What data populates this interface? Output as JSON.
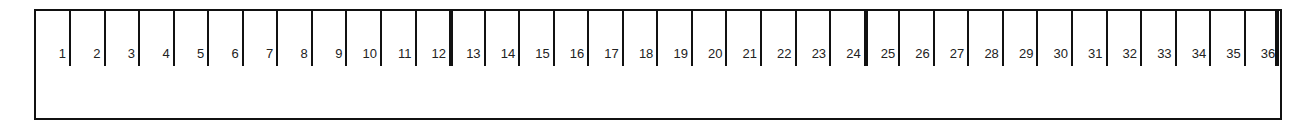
{
  "diagram": {
    "type": "numbered-slot-strip",
    "slot_count": 36,
    "thick_dividers_after": [
      12,
      24,
      36
    ],
    "colors": {
      "line": "#111111",
      "text": "#222222",
      "background": "#ffffff"
    },
    "slots": [
      {
        "label": "1"
      },
      {
        "label": "2"
      },
      {
        "label": "3"
      },
      {
        "label": "4"
      },
      {
        "label": "5"
      },
      {
        "label": "6"
      },
      {
        "label": "7"
      },
      {
        "label": "8"
      },
      {
        "label": "9"
      },
      {
        "label": "10"
      },
      {
        "label": "11"
      },
      {
        "label": "12"
      },
      {
        "label": "13"
      },
      {
        "label": "14"
      },
      {
        "label": "15"
      },
      {
        "label": "16"
      },
      {
        "label": "17"
      },
      {
        "label": "18"
      },
      {
        "label": "19"
      },
      {
        "label": "20"
      },
      {
        "label": "21"
      },
      {
        "label": "22"
      },
      {
        "label": "23"
      },
      {
        "label": "24"
      },
      {
        "label": "25"
      },
      {
        "label": "26"
      },
      {
        "label": "27"
      },
      {
        "label": "28"
      },
      {
        "label": "29"
      },
      {
        "label": "30"
      },
      {
        "label": "31"
      },
      {
        "label": "32"
      },
      {
        "label": "33"
      },
      {
        "label": "34"
      },
      {
        "label": "35"
      },
      {
        "label": "36"
      }
    ]
  }
}
